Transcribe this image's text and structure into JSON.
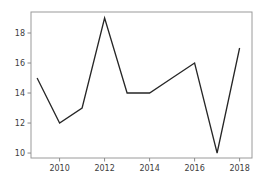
{
  "chart_data": {
    "type": "line",
    "title": "",
    "xlabel": "",
    "ylabel": "",
    "x": [
      2009,
      2010,
      2011,
      2012,
      2013,
      2014,
      2015,
      2016,
      2017,
      2018
    ],
    "values": [
      15,
      12,
      13,
      19,
      14,
      14,
      15,
      16,
      10,
      17
    ],
    "x_ticks": [
      2010,
      2012,
      2014,
      2016,
      2018
    ],
    "y_ticks": [
      10,
      12,
      14,
      16,
      18
    ],
    "xlim": [
      2008.73,
      2018.55
    ],
    "ylim": [
      9.67,
      19.4
    ],
    "grid": false,
    "legend": false,
    "colors": {
      "line": "#262626",
      "spine": "#9a9a9a",
      "tick": "#8a8a8a",
      "tick_label": "#3d3d3d",
      "background": "#ffffff"
    }
  }
}
